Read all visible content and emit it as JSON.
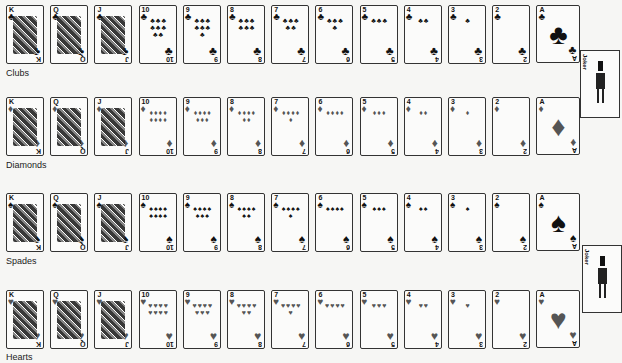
{
  "layout": {
    "card_start_x": 6,
    "card_pitch_x": 44.2,
    "row_tops": [
      5,
      97,
      193,
      290
    ]
  },
  "rows": [
    {
      "suit": "Clubs",
      "label": "Clubs",
      "symbol": "♣",
      "label_y": 68
    },
    {
      "suit": "Diamonds",
      "label": "Diamonds",
      "symbol": "♦",
      "label_y": 160
    },
    {
      "suit": "Spades",
      "label": "Spades",
      "symbol": "♠",
      "label_y": 256
    },
    {
      "suit": "Hearts",
      "label": "Hearts",
      "symbol": "♥",
      "label_y": 352
    }
  ],
  "ranks": [
    "K",
    "Q",
    "J",
    "10",
    "9",
    "8",
    "7",
    "6",
    "5",
    "4",
    "3",
    "2",
    "A"
  ],
  "jokers": [
    {
      "label": "Joker",
      "x": 580,
      "y": 50
    },
    {
      "label": "Joker",
      "x": 582,
      "y": 245
    }
  ]
}
